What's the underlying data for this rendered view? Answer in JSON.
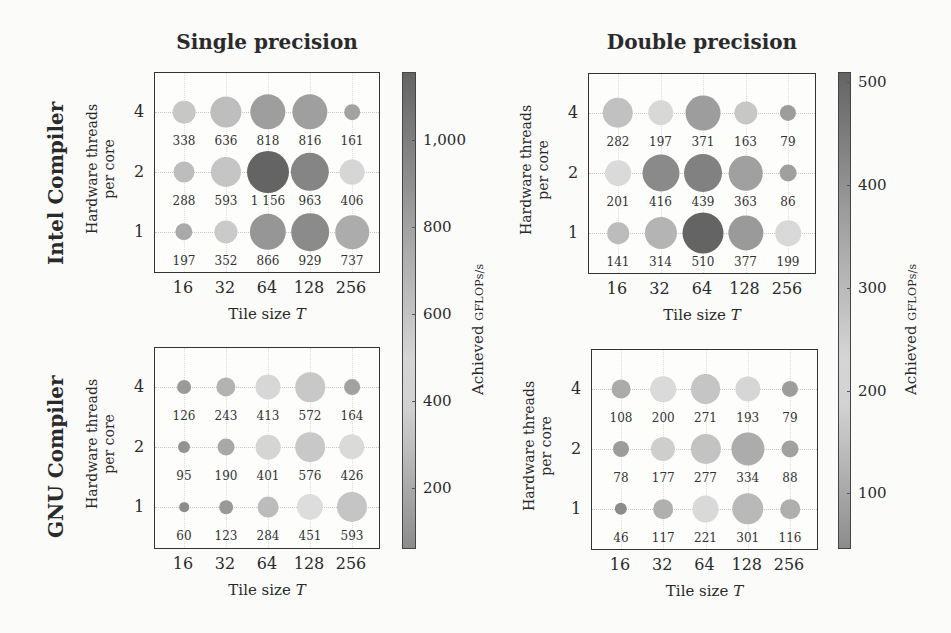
{
  "chart_data": {
    "type": "scatter",
    "subtype": "bubble-grid",
    "column_titles": [
      "Single precision",
      "Double precision"
    ],
    "row_titles": [
      "Intel Compiler",
      "GNU Compiler"
    ],
    "xlabel": "Tile size T",
    "ylabel": "Hardware threads per core",
    "x_categories": [
      "16",
      "32",
      "64",
      "128",
      "256"
    ],
    "y_categories": [
      "4",
      "2",
      "1"
    ],
    "colorbar_label": "Achieved GFLOPs/s",
    "colorbars": [
      {
        "precision": "Single precision",
        "ticks": [
          200,
          400,
          600,
          800,
          1000
        ],
        "tick_labels": [
          "200",
          "400",
          "600",
          "800",
          "1,000"
        ],
        "range": [
          60,
          1156
        ]
      },
      {
        "precision": "Double precision",
        "ticks": [
          100,
          200,
          300,
          400,
          500
        ],
        "tick_labels": [
          "100",
          "200",
          "300",
          "400",
          "500"
        ],
        "range": [
          46,
          510
        ]
      }
    ],
    "panels": [
      {
        "compiler": "Intel Compiler",
        "precision": "Single precision",
        "rows": [
          {
            "threads": "4",
            "values": [
              338,
              636,
              818,
              816,
              161
            ],
            "labels": [
              "338",
              "636",
              "818",
              "816",
              "161"
            ]
          },
          {
            "threads": "2",
            "values": [
              288,
              593,
              1156,
              963,
              406
            ],
            "labels": [
              "288",
              "593",
              "1 156",
              "963",
              "406"
            ]
          },
          {
            "threads": "1",
            "values": [
              197,
              352,
              866,
              929,
              737
            ],
            "labels": [
              "197",
              "352",
              "866",
              "929",
              "737"
            ]
          }
        ]
      },
      {
        "compiler": "Intel Compiler",
        "precision": "Double precision",
        "rows": [
          {
            "threads": "4",
            "values": [
              282,
              197,
              371,
              163,
              79
            ],
            "labels": [
              "282",
              "197",
              "371",
              "163",
              "79"
            ]
          },
          {
            "threads": "2",
            "values": [
              201,
              416,
              439,
              363,
              86
            ],
            "labels": [
              "201",
              "416",
              "439",
              "363",
              "86"
            ]
          },
          {
            "threads": "1",
            "values": [
              141,
              314,
              510,
              377,
              199
            ],
            "labels": [
              "141",
              "314",
              "510",
              "377",
              "199"
            ]
          }
        ]
      },
      {
        "compiler": "GNU Compiler",
        "precision": "Single precision",
        "rows": [
          {
            "threads": "4",
            "values": [
              126,
              243,
              413,
              572,
              164
            ],
            "labels": [
              "126",
              "243",
              "413",
              "572",
              "164"
            ]
          },
          {
            "threads": "2",
            "values": [
              95,
              190,
              401,
              576,
              426
            ],
            "labels": [
              "95",
              "190",
              "401",
              "576",
              "426"
            ]
          },
          {
            "threads": "1",
            "values": [
              60,
              123,
              284,
              451,
              593
            ],
            "labels": [
              "60",
              "123",
              "284",
              "451",
              "593"
            ]
          }
        ]
      },
      {
        "compiler": "GNU Compiler",
        "precision": "Double precision",
        "rows": [
          {
            "threads": "4",
            "values": [
              108,
              200,
              271,
              193,
              79
            ],
            "labels": [
              "108",
              "200",
              "271",
              "193",
              "79"
            ]
          },
          {
            "threads": "2",
            "values": [
              78,
              177,
              277,
              334,
              88
            ],
            "labels": [
              "78",
              "177",
              "277",
              "334",
              "88"
            ]
          },
          {
            "threads": "1",
            "values": [
              46,
              117,
              221,
              301,
              116
            ],
            "labels": [
              "46",
              "117",
              "221",
              "301",
              "116"
            ]
          }
        ]
      }
    ]
  },
  "labels": {
    "col_single": "Single precision",
    "col_double": "Double precision",
    "row_intel": "Intel Compiler",
    "row_gnu": "GNU Compiler",
    "ylabel_line1": "Hardware threads",
    "ylabel_line2": "per core",
    "xlabel_text": "Tile size ",
    "xlabel_var": "T",
    "cb_achieved": "Achieved ",
    "cb_unit": "GFLOPs/s"
  }
}
